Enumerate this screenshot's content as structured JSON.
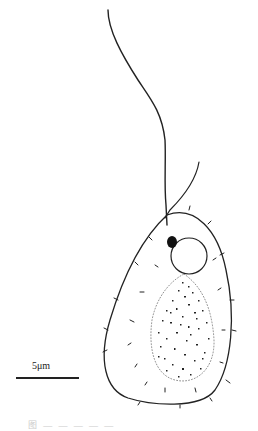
{
  "figure": {
    "scale_bar": {
      "label": "5μm"
    },
    "caption": "图 — — — — —",
    "colors": {
      "ink": "#222222",
      "background": "#ffffff"
    },
    "parts": [
      "flagellum-long",
      "flagellum-short",
      "cell-body",
      "stigma",
      "nucleus",
      "granular-body",
      "surface-spines"
    ]
  }
}
